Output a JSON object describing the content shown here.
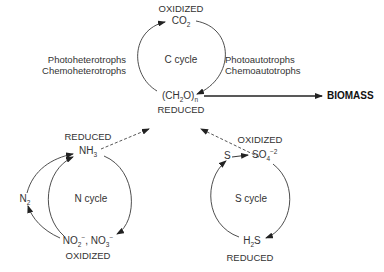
{
  "c_cycle": {
    "label": "C cycle",
    "top_state": "OXIDIZED",
    "top_compound": {
      "base": "CO",
      "sub": "2"
    },
    "bottom_compound": {
      "p1": "(CH",
      "sub1": "2",
      "p2": "O)",
      "sub2": "n"
    },
    "bottom_state": "REDUCED",
    "left_organisms": [
      "Photoheterotrophs",
      "Chemoheterotrophs"
    ],
    "right_organisms": [
      "Photoautotrophs",
      "Chemoautotrophs"
    ]
  },
  "biomass": {
    "label": "BIOMASS"
  },
  "n_cycle": {
    "label": "N cycle",
    "top_state": "REDUCED",
    "top_compound": {
      "base": "NH",
      "sub": "3"
    },
    "side_compound": {
      "base": "N",
      "sub": "2"
    },
    "bottom_compound": {
      "a": "NO",
      "a_sub": "2",
      "a_sup": "−",
      "sep": ", ",
      "b": "NO",
      "b_sub": "3",
      "b_sup": "−"
    },
    "bottom_state": "OXIDIZED"
  },
  "s_cycle": {
    "label": "S cycle",
    "top_state": "OXIDIZED",
    "elemental": "S",
    "top_compound": {
      "base": "SO",
      "sub": "4",
      "sup": "−2"
    },
    "bottom_compound": {
      "p1": "H",
      "sub": "2",
      "p2": "S"
    },
    "bottom_state": "REDUCED"
  },
  "colors": {
    "line": "#3a3a3a",
    "text": "#333333"
  }
}
